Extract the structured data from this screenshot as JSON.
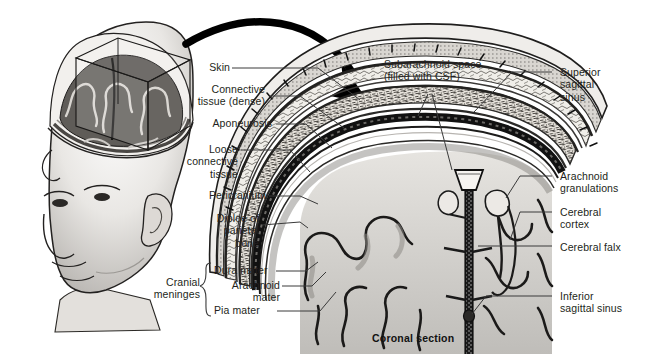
{
  "figure": {
    "caption": "Coronal section",
    "style": "grayscale medical illustration"
  },
  "colors": {
    "background": "#ffffff",
    "text": "#231f20",
    "leader_line": "#3a3a3a",
    "ink_dark": "#111111",
    "gray_mid": "#8a8a8a",
    "gray_light": "#cfcfcf",
    "bone_fill": "#efece6",
    "brain_fill": "#d8d6d2",
    "brain_shadow": "#9a9894"
  },
  "orientation_inset": {
    "name": "head-with-cutaway",
    "description": "Lateral view of a bald male head with skullcap removed revealing brain; a rectangular box marks the coronal section plane",
    "arrow": "curved-arrow-to-detail"
  },
  "labels_left": [
    {
      "id": "skin",
      "text": "Skin"
    },
    {
      "id": "connective-tissue",
      "text": "Connective\ntissue (dense)"
    },
    {
      "id": "aponeurosis",
      "text": "Aponeurosis"
    },
    {
      "id": "loose-connective",
      "text": "Loose\nconnective\ntissue"
    },
    {
      "id": "pericranium",
      "text": "Pericranium"
    },
    {
      "id": "diploe",
      "text": "Diploe of\nparietal\nbone"
    }
  ],
  "labels_meninges": {
    "group_label": "Cranial\nmeninges",
    "items": [
      {
        "id": "dura-mater",
        "text": "Dura mater"
      },
      {
        "id": "arachnoid-mater",
        "text": "Arachnoid\nmater"
      },
      {
        "id": "pia-mater",
        "text": "Pia mater"
      }
    ]
  },
  "labels_top": [
    {
      "id": "subarachnoid-space",
      "text": "Subarachnoid space\n(filled with CSF)"
    }
  ],
  "labels_right": [
    {
      "id": "superior-sagittal-sinus",
      "text": "Superior\nsagittal\nsinus"
    },
    {
      "id": "arachnoid-granulations",
      "text": "Arachnoid\ngranulations"
    },
    {
      "id": "cerebral-cortex",
      "text": "Cerebral\ncortex"
    },
    {
      "id": "cerebral-falx",
      "text": "Cerebral falx"
    },
    {
      "id": "inferior-sagittal-sinus",
      "text": "Inferior\nsagittal sinus"
    }
  ]
}
